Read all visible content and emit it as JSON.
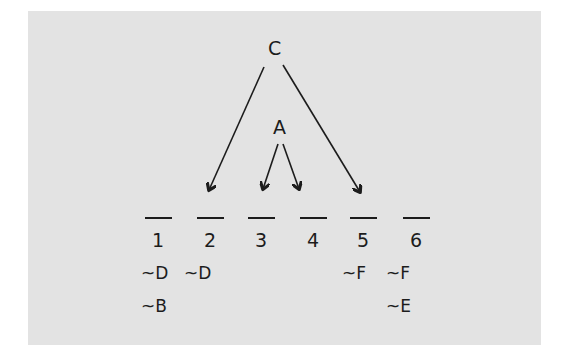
{
  "diagram": {
    "background_color": "#e3e3e3",
    "ink_color": "#1c1c1c",
    "variables": [
      {
        "id": "C",
        "label": "C",
        "arrows_to_slots": [
          2,
          5
        ]
      },
      {
        "id": "A",
        "label": "A",
        "arrows_to_slots": [
          3,
          4
        ]
      }
    ],
    "slots": [
      {
        "number": "1",
        "constraints": [
          "~D",
          "~B"
        ]
      },
      {
        "number": "2",
        "constraints": [
          "~D"
        ]
      },
      {
        "number": "3",
        "constraints": []
      },
      {
        "number": "4",
        "constraints": []
      },
      {
        "number": "5",
        "constraints": [
          "~F"
        ]
      },
      {
        "number": "6",
        "constraints": [
          "~F",
          "~E"
        ]
      }
    ]
  }
}
